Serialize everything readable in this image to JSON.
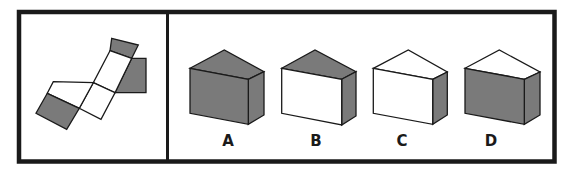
{
  "colors": {
    "face_dark": "#7a7a7a",
    "face_light": "#ffffff",
    "stroke": "#1a1a1a",
    "border": "#1a1a1a"
  },
  "puzzle": {
    "net": {
      "description": "unfolded net of a pentagonal prism",
      "faces": [
        {
          "id": "top-end",
          "shade": "dark"
        },
        {
          "id": "right-side",
          "shade": "dark"
        },
        {
          "id": "middle-rect",
          "shade": "light"
        },
        {
          "id": "lower-square",
          "shade": "light"
        },
        {
          "id": "left-face",
          "shade": "light"
        },
        {
          "id": "bottom-left-square",
          "shade": "dark"
        }
      ]
    },
    "options": [
      {
        "label": "A",
        "front": "dark",
        "top": "dark",
        "side": "dark"
      },
      {
        "label": "B",
        "front": "light",
        "top": "dark",
        "side": "dark"
      },
      {
        "label": "C",
        "front": "light",
        "top": "light",
        "side": "dark"
      },
      {
        "label": "D",
        "front": "dark",
        "top": "light",
        "side": "dark"
      }
    ]
  }
}
